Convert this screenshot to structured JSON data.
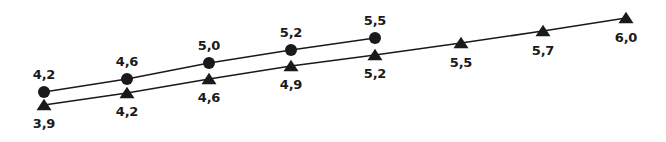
{
  "chart_data": {
    "type": "line",
    "title": "",
    "subtitle": "",
    "xlabel": "",
    "ylabel": "",
    "grid": false,
    "axes_visible": false,
    "legend": false,
    "legend_position": "none",
    "decimal_separator": ",",
    "x": [
      1,
      2,
      3,
      4,
      5,
      6,
      7,
      8
    ],
    "xlim": [
      0.5,
      8.5
    ],
    "ylim": [
      3.7,
      6.2
    ],
    "series": [
      {
        "name": "circle-series",
        "marker": "circle",
        "color": "#1a1a1a",
        "label_position": "above",
        "x": [
          1,
          2,
          3,
          4,
          5
        ],
        "values": [
          4.2,
          4.6,
          5.0,
          5.2,
          5.5
        ],
        "labels": [
          "4,2",
          "4,6",
          "5,0",
          "5,2",
          "5,5"
        ],
        "points": [
          {
            "label": "4,2",
            "cx": 44,
            "cy": 92,
            "lx": 44,
            "ly": 68
          },
          {
            "label": "4,6",
            "cx": 127,
            "cy": 79,
            "lx": 127,
            "ly": 55
          },
          {
            "label": "5,0",
            "cx": 209,
            "cy": 63,
            "lx": 209,
            "ly": 39
          },
          {
            "label": "5,2",
            "cx": 291,
            "cy": 50,
            "lx": 291,
            "ly": 26
          },
          {
            "label": "5,5",
            "cx": 375,
            "cy": 38,
            "lx": 375,
            "ly": 14
          }
        ]
      },
      {
        "name": "triangle-series",
        "marker": "triangle",
        "color": "#1a1a1a",
        "label_position": "below",
        "x": [
          1,
          2,
          3,
          4,
          5,
          6,
          7,
          8
        ],
        "values": [
          3.9,
          4.2,
          4.6,
          4.9,
          5.2,
          5.5,
          5.7,
          6.0
        ],
        "labels": [
          "3,9",
          "4,2",
          "4,6",
          "4,9",
          "5,2",
          "5,5",
          "5,7",
          "6,0"
        ],
        "points": [
          {
            "label": "3,9",
            "cx": 44,
            "cy": 105,
            "lx": 44,
            "ly": 117
          },
          {
            "label": "4,2",
            "cx": 127,
            "cy": 93,
            "lx": 127,
            "ly": 105
          },
          {
            "label": "4,6",
            "cx": 209,
            "cy": 79,
            "lx": 209,
            "ly": 91
          },
          {
            "label": "4,9",
            "cx": 291,
            "cy": 66,
            "lx": 291,
            "ly": 78
          },
          {
            "label": "5,2",
            "cx": 375,
            "cy": 55,
            "lx": 375,
            "ly": 67
          },
          {
            "label": "5,5",
            "cx": 461,
            "cy": 43,
            "lx": 461,
            "ly": 56
          },
          {
            "label": "5,7",
            "cx": 543,
            "cy": 31,
            "lx": 543,
            "ly": 44
          },
          {
            "label": "6,0",
            "cx": 626,
            "cy": 18,
            "lx": 626,
            "ly": 31
          }
        ]
      }
    ]
  },
  "style": {
    "background": "#ffffff",
    "line_color": "#1a1a1a",
    "marker_color": "#1a1a1a",
    "label_color": "#1a1a1a"
  }
}
